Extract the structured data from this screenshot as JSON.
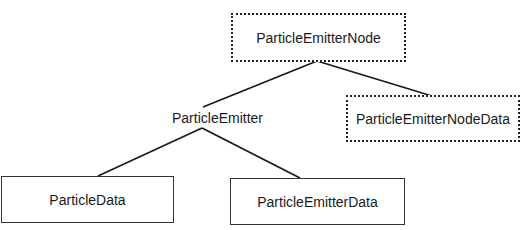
{
  "diagram": {
    "type": "class-hierarchy",
    "nodes": [
      {
        "id": "node",
        "label": "ParticleEmitterNode",
        "style": "dashed"
      },
      {
        "id": "emitter",
        "label": "ParticleEmitter",
        "style": "plain"
      },
      {
        "id": "nodedata",
        "label": "ParticleEmitterNodeData",
        "style": "dashed"
      },
      {
        "id": "pdata",
        "label": "ParticleData",
        "style": "solid"
      },
      {
        "id": "edata",
        "label": "ParticleEmitterData",
        "style": "solid"
      }
    ],
    "edges": [
      {
        "from": "ParticleEmitterNode",
        "to": "ParticleEmitter"
      },
      {
        "from": "ParticleEmitterNode",
        "to": "ParticleEmitterNodeData"
      },
      {
        "from": "ParticleEmitter",
        "to": "ParticleData"
      },
      {
        "from": "ParticleEmitter",
        "to": "ParticleEmitterData"
      }
    ]
  }
}
